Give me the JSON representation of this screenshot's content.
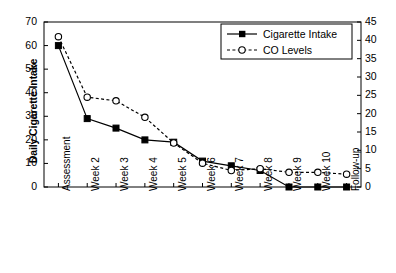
{
  "chart_data": {
    "type": "line",
    "title": "",
    "xlabel": "",
    "categories": [
      "Assessment",
      "Week 2",
      "Week 3",
      "Week 4",
      "Week 5",
      "Week 6",
      "Week 7",
      "Week 8",
      "Week 9",
      "Week 10",
      "Follow-up"
    ],
    "grid": false,
    "legend_position": "top-right",
    "axes": [
      {
        "id": "left",
        "label": "Daily Cigarette Intake",
        "lim": [
          0,
          70
        ],
        "step": 10,
        "ticks": [
          "0",
          "10",
          "20",
          "30",
          "40",
          "50",
          "60",
          "70"
        ]
      },
      {
        "id": "right",
        "label": "Weekly CO Levels (ppm)",
        "lim": [
          0,
          45
        ],
        "step": 5,
        "ticks": [
          "0",
          "5",
          "10",
          "15",
          "20",
          "25",
          "30",
          "35",
          "40",
          "45"
        ]
      }
    ],
    "series": [
      {
        "name": "Cigarette Intake",
        "axis": "left",
        "marker": "filled-square",
        "line": "solid",
        "color": "#000000",
        "values": [
          60,
          29,
          25,
          20,
          19,
          11,
          9,
          7,
          0,
          0,
          0
        ]
      },
      {
        "name": "CO Levels",
        "axis": "right",
        "marker": "open-circle",
        "line": "dashed",
        "color": "#000000",
        "values": [
          41,
          24.5,
          23.5,
          19,
          12,
          6.5,
          4.5,
          5,
          4,
          4,
          3.5
        ]
      }
    ]
  },
  "legend": {
    "items": [
      {
        "label": "Cigarette Intake"
      },
      {
        "label": "CO Levels"
      }
    ]
  }
}
